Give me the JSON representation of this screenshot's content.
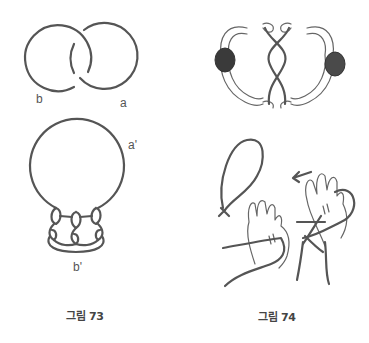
{
  "figure73": {
    "caption": "그림 73",
    "top_diagram": {
      "label_left": "b",
      "label_right": "a",
      "description": "two interlocking rings"
    },
    "bottom_diagram": {
      "label_top": "a'",
      "label_bottom": "b'",
      "description": "large loop with three interlaced knots at bottom"
    }
  },
  "figure74": {
    "caption": "그림 74",
    "top_diagram": {
      "description": "two people lying head-to-head twisting strings between hands"
    },
    "bottom_diagram": {
      "description": "hands passing a looped string, arrow pointing left",
      "arrow": "←"
    }
  }
}
